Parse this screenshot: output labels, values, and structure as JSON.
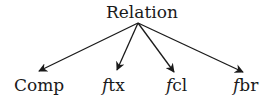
{
  "diagram": {
    "type": "tree",
    "root": {
      "label": "Relation"
    },
    "children": [
      {
        "prefix": "",
        "label": "Comp"
      },
      {
        "prefix": "f",
        "label": "tx"
      },
      {
        "prefix": "f",
        "label": "cl"
      },
      {
        "prefix": "f",
        "label": "br"
      }
    ],
    "edges": [
      {
        "from": "Relation",
        "to": "Comp"
      },
      {
        "from": "Relation",
        "to": "ftx"
      },
      {
        "from": "Relation",
        "to": "fcl"
      },
      {
        "from": "Relation",
        "to": "fbr"
      }
    ],
    "colors": {
      "line": "#1a1a1a",
      "text": "#1a1a1a",
      "background": "#ffffff"
    }
  }
}
